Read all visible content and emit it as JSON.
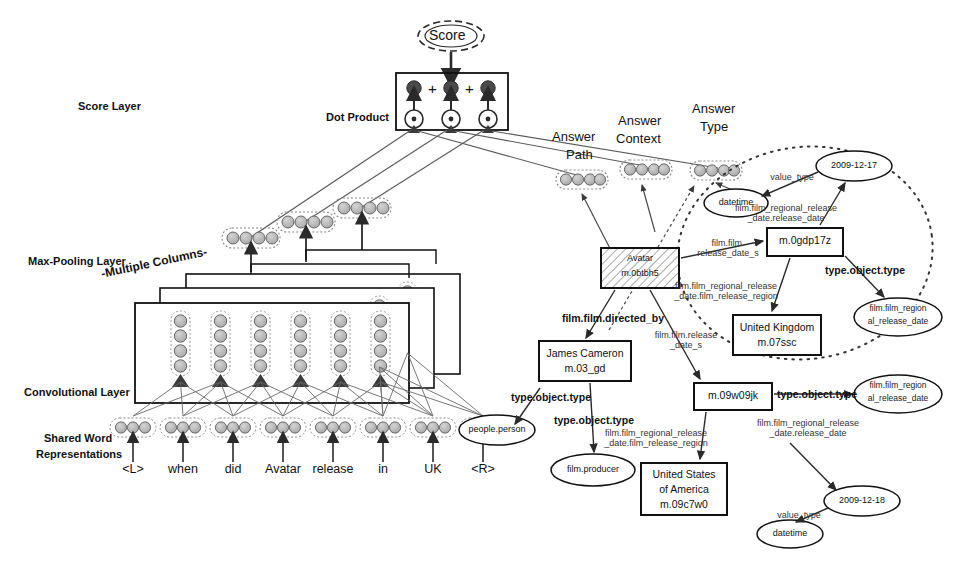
{
  "figure": {
    "type": "neural-network-knowledge-graph-diagram"
  },
  "network": {
    "layer_labels": [
      {
        "name": "score-layer",
        "text": "Score Layer",
        "x": 78,
        "y": 100
      },
      {
        "name": "max-pooling-layer",
        "text": "Max-Pooling Layer",
        "x": 28,
        "y": 255
      },
      {
        "name": "convolutional-layer",
        "text": "Convolutional Layer",
        "x": 24,
        "y": 386
      },
      {
        "name": "shared-word-representations-line1",
        "text": "Shared Word",
        "x": 44,
        "y": 432
      },
      {
        "name": "shared-word-representations-line2",
        "text": "Representations",
        "x": 36,
        "y": 448
      }
    ],
    "dot_product_label": "Dot Product",
    "multiple_columns_label": "-Multiple Columns-",
    "score_node_label": "Score",
    "plus_signs": [
      "+",
      "+"
    ],
    "words": [
      "<L>",
      "when",
      "did",
      "Avatar",
      "release",
      "in",
      "UK",
      "<R>"
    ],
    "word_vector_units": 3,
    "conv_vector_units": 4,
    "pool_vector_units": 4,
    "answer_vector_units": 4,
    "num_columns": 3,
    "num_conv_units_per_column": 7,
    "dot_product_units": 3
  },
  "answer_channels": [
    {
      "name": "answer-path",
      "line1": "Answer",
      "line2": "Path",
      "x": 552,
      "y": 136
    },
    {
      "name": "answer-context",
      "line1": "Answer",
      "line2": "Context",
      "x": 618,
      "y": 121
    },
    {
      "name": "answer-type",
      "line1": "Answer",
      "line2": "Type",
      "x": 692,
      "y": 110
    }
  ],
  "graph": {
    "entities": [
      {
        "name": "entity-avatar",
        "shape": "box-hatched",
        "lines": [
          "Avatar",
          "m.0btbh5"
        ],
        "x": 601,
        "y": 248,
        "w": 78,
        "h": 40
      },
      {
        "name": "entity-m-0gdp17z",
        "shape": "box",
        "lines": [
          "m.0gdp17z"
        ],
        "x": 767,
        "y": 228,
        "w": 76,
        "h": 28
      },
      {
        "name": "entity-united-kingdom",
        "shape": "box",
        "lines": [
          "United Kingdom",
          "m.07ssc"
        ],
        "x": 733,
        "y": 315,
        "w": 88,
        "h": 40
      },
      {
        "name": "entity-m-09w09jk",
        "shape": "box",
        "lines": [
          "m.09w09jk"
        ],
        "x": 694,
        "y": 383,
        "w": 78,
        "h": 27
      },
      {
        "name": "entity-james-cameron",
        "shape": "box",
        "lines": [
          "James Cameron",
          "m.03_gd"
        ],
        "x": 539,
        "y": 341,
        "w": 92,
        "h": 40
      },
      {
        "name": "entity-united-states",
        "shape": "box",
        "lines": [
          "United States",
          "of America",
          "m.09c7w0"
        ],
        "x": 641,
        "y": 463,
        "w": 86,
        "h": 52
      }
    ],
    "types": [
      {
        "name": "type-datetime-top",
        "shape": "ellipse",
        "lines": [
          "datetime"
        ],
        "cx": 736,
        "cy": 203,
        "rx": 32,
        "ry": 14
      },
      {
        "name": "type-2009-12-17",
        "shape": "ellipse",
        "lines": [
          "2009-12-17"
        ],
        "cx": 854,
        "cy": 166,
        "rx": 38,
        "ry": 15
      },
      {
        "name": "type-film-regional-release-date-1",
        "shape": "ellipse",
        "lines": [
          "film.film_region",
          "al_release_date"
        ],
        "cx": 898,
        "cy": 317,
        "rx": 44,
        "ry": 19
      },
      {
        "name": "type-film-regional-release-date-2",
        "shape": "ellipse",
        "lines": [
          "film.film_region",
          "al_release_date"
        ],
        "cx": 898,
        "cy": 394,
        "rx": 44,
        "ry": 19
      },
      {
        "name": "type-people-person",
        "shape": "ellipse",
        "lines": [
          "people.person"
        ],
        "cx": 497,
        "cy": 430,
        "rx": 38,
        "ry": 15
      },
      {
        "name": "type-film-producer",
        "shape": "ellipse",
        "lines": [
          "film.producer"
        ],
        "cx": 593,
        "cy": 470,
        "rx": 42,
        "ry": 16
      },
      {
        "name": "type-2009-12-18",
        "shape": "ellipse",
        "lines": [
          "2009-12-18"
        ],
        "cx": 862,
        "cy": 501,
        "rx": 38,
        "ry": 15
      },
      {
        "name": "type-datetime-bottom",
        "shape": "ellipse",
        "lines": [
          "datetime"
        ],
        "cx": 790,
        "cy": 534,
        "rx": 33,
        "ry": 14
      }
    ],
    "relations": [
      {
        "name": "rel-value-type-top",
        "text": "value_type",
        "x": 757,
        "y": 172,
        "bold": false,
        "size": 9.5
      },
      {
        "name": "rel-film-film-regional-release-date-release-date-top",
        "text": "film.film_regional_release\n_date.release_date",
        "x": 781,
        "y": 203,
        "bold": false,
        "size": 9
      },
      {
        "name": "rel-film-film-release-date-s-top",
        "text": "film.film.\nrelease_date_s",
        "x": 691,
        "y": 238,
        "bold": false,
        "size": 9.5
      },
      {
        "name": "rel-type-object-type-0gdp17z",
        "text": "type.object.type",
        "x": 822,
        "y": 264,
        "bold": true,
        "size": 10
      },
      {
        "name": "rel-film-film-regional-release-date-film-release-region-uk",
        "text": "film.film_regional_release\n_date.film_release_region",
        "x": 720,
        "y": 281,
        "bold": false,
        "size": 9
      },
      {
        "name": "rel-film-film-directed-by",
        "text": "film.film.directed_by",
        "x": 557,
        "y": 312,
        "bold": true,
        "size": 10
      },
      {
        "name": "rel-film-film-release-date-s-bottom",
        "text": "film.film.release\n_date_s",
        "x": 655,
        "y": 330,
        "bold": false,
        "size": 9.5
      },
      {
        "name": "rel-type-object-type-james-cameron-left",
        "text": "type.object.type",
        "x": 506,
        "y": 391,
        "bold": true,
        "size": 10
      },
      {
        "name": "rel-type-object-type-james-cameron-down",
        "text": "type.object.type",
        "x": 550,
        "y": 414,
        "bold": true,
        "size": 10
      },
      {
        "name": "rel-type-object-type-09w09jk",
        "text": "type.object.type",
        "x": 772,
        "y": 389,
        "bold": true,
        "size": 10
      },
      {
        "name": "rel-film-film-regional-release-date-release-date-bottom",
        "text": "film.film_regional_release\n_date.release_date",
        "x": 756,
        "y": 418,
        "bold": false,
        "size": 9
      },
      {
        "name": "rel-film-film-regional-release-date-film-release-region-usa",
        "text": "film.film_regional_release\n_date.film_release_region",
        "x": 650,
        "y": 428,
        "bold": false,
        "size": 9
      },
      {
        "name": "rel-value-type-bottom",
        "text": "value_type",
        "x": 766,
        "y": 510,
        "bold": false,
        "size": 9.5
      }
    ],
    "subgraph_boundary": {
      "name": "answer-type-subgraph-ellipse",
      "style": "dotted",
      "cx": 805,
      "cy": 253,
      "rx": 128,
      "ry": 105,
      "rotation": -8
    }
  },
  "colors": {
    "ink": "#1a1a1a",
    "node_fill": "#b8b8b8",
    "node_stroke": "#555555",
    "dark_node": "#4a4a4a",
    "line": "#5a5a5a",
    "box_stroke": "#111111"
  }
}
